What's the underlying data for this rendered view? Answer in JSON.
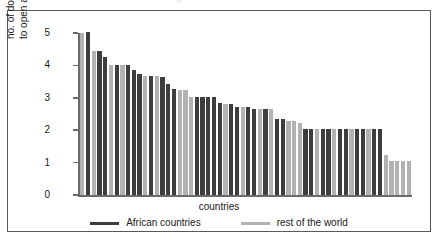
{
  "figure": {
    "x_axis_title": "countries",
    "y_axis_title_line1": "no. of documents required",
    "y_axis_title_line2": "to open an account",
    "y_ticks": [
      "5",
      "4",
      "3",
      "2",
      "1",
      "0"
    ],
    "legend": [
      {
        "label": "African countries",
        "color": "#3d3d3f",
        "key": "african"
      },
      {
        "label": "rest of the world",
        "color": "#b2b2b4",
        "key": "world"
      }
    ]
  },
  "chart_data": {
    "type": "bar",
    "title": "",
    "xlabel": "countries",
    "ylabel": "no. of documents required to open an account",
    "ylim": [
      0,
      5
    ],
    "yticks": [
      0,
      1,
      2,
      3,
      4,
      5
    ],
    "grid": false,
    "legend_position": "bottom-center",
    "series": [
      {
        "name": "African countries",
        "color": "#3d3d3f"
      },
      {
        "name": "rest of the world",
        "color": "#b2b2b4"
      }
    ],
    "categories": [
      "c1",
      "c2",
      "c3",
      "c4",
      "c5",
      "c6",
      "c7",
      "c8",
      "c9",
      "c10",
      "c11",
      "c12",
      "c13",
      "c14",
      "c15",
      "c16",
      "c17",
      "c18",
      "c19",
      "c20",
      "c21",
      "c22",
      "c23",
      "c24",
      "c25",
      "c26",
      "c27",
      "c28",
      "c29",
      "c30",
      "c31",
      "c32",
      "c33",
      "c34",
      "c35",
      "c36",
      "c37",
      "c38",
      "c39",
      "c40",
      "c41",
      "c42",
      "c43",
      "c44",
      "c45",
      "c46",
      "c47",
      "c48",
      "c49",
      "c50",
      "c51",
      "c52",
      "c53",
      "c54",
      "c55",
      "c56",
      "c57",
      "c58"
    ],
    "values": [
      5.0,
      5.02,
      4.45,
      4.43,
      4.26,
      4.02,
      4.02,
      4.02,
      4.02,
      3.85,
      3.72,
      3.68,
      3.68,
      3.66,
      3.63,
      3.43,
      3.28,
      3.25,
      3.25,
      3.03,
      3.03,
      3.03,
      3.03,
      3.03,
      2.85,
      2.82,
      2.8,
      2.72,
      2.72,
      2.72,
      2.64,
      2.64,
      2.64,
      2.64,
      2.36,
      2.36,
      2.27,
      2.27,
      2.22,
      2.05,
      2.05,
      2.05,
      2.05,
      2.05,
      2.05,
      2.05,
      2.05,
      2.05,
      2.05,
      2.05,
      2.05,
      2.05,
      2.05,
      1.25,
      1.05,
      1.05,
      1.05,
      1.05
    ],
    "groups": [
      "world",
      "african",
      "world",
      "african",
      "african",
      "world",
      "african",
      "world",
      "african",
      "african",
      "african",
      "world",
      "african",
      "world",
      "african",
      "african",
      "african",
      "world",
      "world",
      "world",
      "african",
      "african",
      "african",
      "african",
      "african",
      "world",
      "african",
      "african",
      "world",
      "african",
      "african",
      "world",
      "african",
      "world",
      "african",
      "african",
      "world",
      "world",
      "world",
      "african",
      "african",
      "world",
      "african",
      "african",
      "world",
      "african",
      "african",
      "world",
      "african",
      "african",
      "world",
      "african",
      "african",
      "world",
      "world",
      "world",
      "world",
      "world"
    ]
  }
}
